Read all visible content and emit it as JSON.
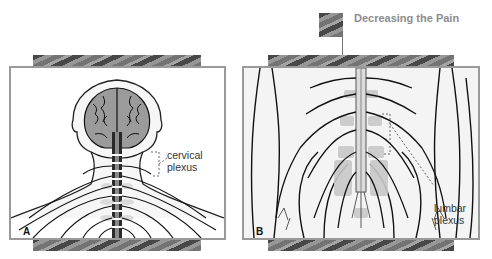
{
  "header": {
    "title": "Decreasing the Pain",
    "title_color": "#8c8c8c",
    "thumbnail_icon": "texture-thumbnail-icon"
  },
  "panels": [
    {
      "letter": "A",
      "subject": "head-neck-posterior-view",
      "callout_label_line1": "cervical",
      "callout_label_line2": "plexus"
    },
    {
      "letter": "B",
      "subject": "lower-back-pelvis-posterior-view",
      "callout_label_line1": "lumbar",
      "callout_label_line2": "plexus"
    }
  ],
  "colors": {
    "frame_border": "#9a9a9a",
    "texture_band": "#8a8a8a",
    "brain_fill": "#9b9b9b",
    "nerve_stroke": "#111111"
  }
}
